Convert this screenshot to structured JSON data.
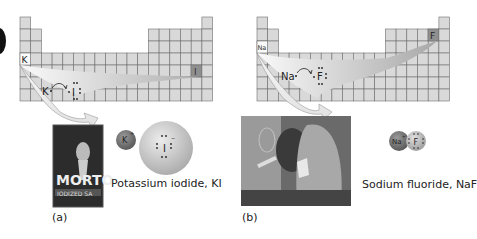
{
  "panels": [
    {
      "id": "a",
      "label": "(a)",
      "metal": {
        "symbol": "K",
        "cell": {
          "col": 0,
          "row": 3
        }
      },
      "nonmetal": {
        "symbol": "I",
        "cell": {
          "col": 16,
          "row": 4
        }
      },
      "lewis": {
        "metal": "K",
        "nonmetal": "I"
      },
      "model": {
        "cation": "K",
        "cation_charge": "+",
        "anion": "I",
        "anion_charge": "−"
      },
      "photo": {
        "subject": "salt-container",
        "brand_text": "MORTO",
        "sub_text": "IODIZED SA"
      },
      "caption": "Potassium iodide, KI"
    },
    {
      "id": "b",
      "label": "(b)",
      "metal": {
        "symbol": "Na",
        "cell": {
          "col": 0,
          "row": 2
        }
      },
      "nonmetal": {
        "symbol": "F",
        "cell": {
          "col": 16,
          "row": 1
        }
      },
      "lewis": {
        "metal": "Na",
        "nonmetal": "F"
      },
      "model": {
        "cation": "Na",
        "cation_charge": "+",
        "anion": "F",
        "anion_charge": "−"
      },
      "photo": {
        "subject": "children-brushing-teeth"
      },
      "caption": "Sodium fluoride, NaF"
    }
  ],
  "colors": {
    "cell_fill": "#d9d9d9",
    "cell_stroke": "#6e6e6e",
    "highlight_cell": "#8a8a8a",
    "arrow_light": "#f4f4f4",
    "arrow_dark": "#b5b5b5",
    "sphere_small": "#7a7a7a",
    "sphere_large": "#cfcfcf"
  }
}
